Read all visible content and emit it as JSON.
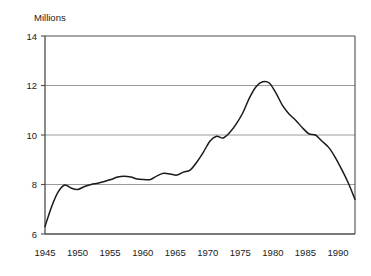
{
  "chart_data": {
    "type": "line",
    "title": "",
    "ylabel": "Millions",
    "xlabel": "",
    "ylim": [
      6,
      14
    ],
    "xlim": [
      1945,
      1992
    ],
    "yticks": [
      6,
      8,
      10,
      12,
      14
    ],
    "ytick_labels": [
      "6",
      "8",
      "10",
      "12",
      "14"
    ],
    "xticks": [
      1945,
      1950,
      1955,
      1960,
      1965,
      1970,
      1975,
      1980,
      1985,
      1990
    ],
    "xtick_labels": [
      "1945",
      "1950",
      "1955",
      "1960",
      "1965",
      "1970",
      "1975",
      "1980",
      "1985",
      "1990"
    ],
    "gridlines": {
      "horizontal": [
        8,
        10,
        12
      ],
      "vertical": []
    },
    "legend": {
      "visible": false,
      "position": "none",
      "entries": []
    },
    "line_color": "#1a1a1a",
    "grid_color": "#9a9a9a",
    "axis_color": "#4d4d4d",
    "series": [
      {
        "name": "",
        "x": [
          1945,
          1946,
          1947,
          1948,
          1949,
          1950,
          1951,
          1952,
          1953,
          1954,
          1955,
          1956,
          1957,
          1958,
          1959,
          1960,
          1961,
          1962,
          1963,
          1964,
          1965,
          1966,
          1967,
          1968,
          1969,
          1970,
          1971,
          1972,
          1973,
          1974,
          1975,
          1976,
          1977,
          1978,
          1979,
          1980,
          1981,
          1982,
          1983,
          1984,
          1985,
          1986,
          1987,
          1988,
          1989,
          1990,
          1991,
          1992
        ],
        "values": [
          6.3,
          7.1,
          7.7,
          7.98,
          7.85,
          7.8,
          7.92,
          8.0,
          8.05,
          8.12,
          8.2,
          8.3,
          8.33,
          8.3,
          8.22,
          8.2,
          8.2,
          8.35,
          8.45,
          8.42,
          8.38,
          8.5,
          8.58,
          8.9,
          9.3,
          9.75,
          9.95,
          9.88,
          10.1,
          10.45,
          10.9,
          11.5,
          11.95,
          12.15,
          12.1,
          11.7,
          11.2,
          10.85,
          10.6,
          10.3,
          10.05,
          10.0,
          9.75,
          9.5,
          9.1,
          8.6,
          8.05,
          7.4
        ]
      }
    ],
    "annotations": []
  }
}
